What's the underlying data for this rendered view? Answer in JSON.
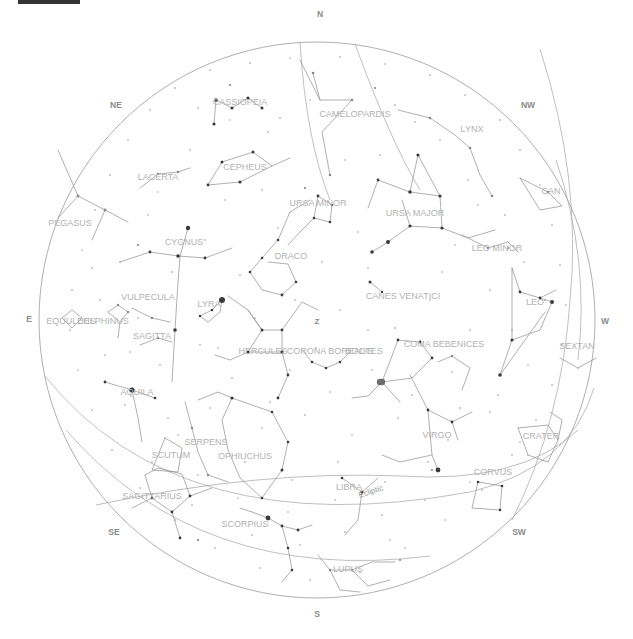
{
  "app": {
    "title": "Star Chart",
    "background_color": "#ffffff",
    "topbar_color": "#333333"
  },
  "chart_data": {
    "type": "scatter",
    "projection": "stereographic-horizon",
    "center": {
      "x": 317,
      "y": 320
    },
    "radius": 278,
    "grid": false,
    "legend": false,
    "xlabel": "",
    "ylabel": "",
    "zenith": {
      "label": "Z",
      "x": 317,
      "y": 322
    },
    "cardinals": [
      {
        "label": "N",
        "x": 320,
        "y": 15
      },
      {
        "label": "NE",
        "x": 116,
        "y": 106
      },
      {
        "label": "NW",
        "x": 528,
        "y": 106
      },
      {
        "label": "E",
        "x": 29,
        "y": 320
      },
      {
        "label": "W",
        "x": 605,
        "y": 322
      },
      {
        "label": "SE",
        "x": 114,
        "y": 533
      },
      {
        "label": "SW",
        "x": 519,
        "y": 533
      },
      {
        "label": "S",
        "x": 317,
        "y": 615
      }
    ],
    "ecliptic": {
      "label": "Ecliptic",
      "x": 371,
      "y": 492,
      "rotation": -18
    },
    "constellations": [
      {
        "name": "CASSIOPEIA",
        "x": 240,
        "y": 103
      },
      {
        "name": "CAMELOPARDIS",
        "x": 355,
        "y": 115
      },
      {
        "name": "LYNX",
        "x": 472,
        "y": 130
      },
      {
        "name": "CEPHEUS",
        "x": 245,
        "y": 168
      },
      {
        "name": "LACERTA",
        "x": 158,
        "y": 178
      },
      {
        "name": "URSA MINOR",
        "x": 318,
        "y": 204
      },
      {
        "name": "URSA MAJOR",
        "x": 415,
        "y": 214
      },
      {
        "name": "CAN",
        "x": 551,
        "y": 192
      },
      {
        "name": "PEGASUS",
        "x": 70,
        "y": 224
      },
      {
        "name": "CYGNUS",
        "x": 184,
        "y": 243
      },
      {
        "name": "DRACO",
        "x": 291,
        "y": 257
      },
      {
        "name": "LEO MINOR",
        "x": 497,
        "y": 249
      },
      {
        "name": "VULPECULA",
        "x": 148,
        "y": 298
      },
      {
        "name": "LYRA",
        "x": 209,
        "y": 305
      },
      {
        "name": "CANES VENATICI",
        "x": 403,
        "y": 297
      },
      {
        "name": "LEO",
        "x": 535,
        "y": 303
      },
      {
        "name": "EQUULEUS",
        "x": 71,
        "y": 322
      },
      {
        "name": "DELPHINUS",
        "x": 103,
        "y": 322
      },
      {
        "name": "SAGITTA",
        "x": 152,
        "y": 337
      },
      {
        "name": "HERCULES",
        "x": 263,
        "y": 352
      },
      {
        "name": "CORONA BOREALIS",
        "x": 330,
        "y": 352
      },
      {
        "name": "BOOTES",
        "x": 364,
        "y": 352
      },
      {
        "name": "COMA BEBENICES",
        "x": 444,
        "y": 345
      },
      {
        "name": "SEXTAN",
        "x": 577,
        "y": 347
      },
      {
        "name": "AQUILA",
        "x": 137,
        "y": 393
      },
      {
        "name": "VIRGO",
        "x": 437,
        "y": 436
      },
      {
        "name": "CRATER",
        "x": 541,
        "y": 437
      },
      {
        "name": "SERPENS",
        "x": 206,
        "y": 443
      },
      {
        "name": "OPHIUCHUS",
        "x": 245,
        "y": 457
      },
      {
        "name": "SCUTUM",
        "x": 171,
        "y": 456
      },
      {
        "name": "CORVUS",
        "x": 493,
        "y": 473
      },
      {
        "name": "LIBRA",
        "x": 349,
        "y": 488
      },
      {
        "name": "SAGITTARIUS",
        "x": 152,
        "y": 497
      },
      {
        "name": "SCORPIUS",
        "x": 245,
        "y": 525
      },
      {
        "name": "LUPUS",
        "x": 348,
        "y": 570
      }
    ]
  }
}
